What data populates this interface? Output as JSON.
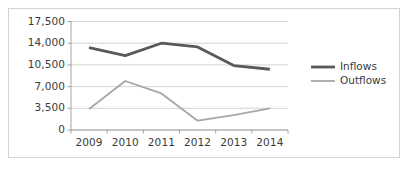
{
  "chart_data": {
    "type": "line",
    "title": "",
    "subtitle": "",
    "xlabel": "",
    "ylabel": "",
    "categories": [
      "2009",
      "2010",
      "2011",
      "2012",
      "2013",
      "2014"
    ],
    "x": [
      2009,
      2010,
      2011,
      2012,
      2013,
      2014
    ],
    "series": [
      {
        "name": "Inflows",
        "color": "#595959",
        "line_width": 2.8,
        "values": [
          13300,
          12000,
          14000,
          13400,
          10400,
          9800
        ]
      },
      {
        "name": "Outflows",
        "color": "#a6a6a6",
        "line_width": 1.8,
        "values": [
          3400,
          7900,
          5900,
          1500,
          2400,
          3500
        ]
      }
    ],
    "ylim": [
      0,
      17500
    ],
    "ytick_labels": [
      "0",
      "3,500",
      "7,000",
      "10,500",
      "14,000",
      "17,500"
    ],
    "ytick_values": [
      0,
      3500,
      7000,
      10500,
      14000,
      17500
    ],
    "grid": "horizontal",
    "gridline_color": "#c8c8c8",
    "axis_color": "#9a9a9a",
    "legend_position": "right",
    "legend_entries": [
      "Inflows",
      "Outflows"
    ],
    "plot_background": "#ffffff",
    "border_color": "#d4d4d4",
    "text_color": "#3b3b3b"
  },
  "axes": {
    "y_ticks": [
      {
        "label": "17,500",
        "value": 17500
      },
      {
        "label": "14,000",
        "value": 14000
      },
      {
        "label": "10,500",
        "value": 10500
      },
      {
        "label": "7,000",
        "value": 7000
      },
      {
        "label": "3,500",
        "value": 3500
      },
      {
        "label": "0",
        "value": 0
      }
    ],
    "x_ticks": [
      {
        "label": "2009"
      },
      {
        "label": "2010"
      },
      {
        "label": "2011"
      },
      {
        "label": "2012"
      },
      {
        "label": "2013"
      },
      {
        "label": "2014"
      }
    ]
  },
  "legend": {
    "items": [
      {
        "label": "Inflows",
        "color": "#595959"
      },
      {
        "label": "Outflows",
        "color": "#a6a6a6"
      }
    ]
  }
}
